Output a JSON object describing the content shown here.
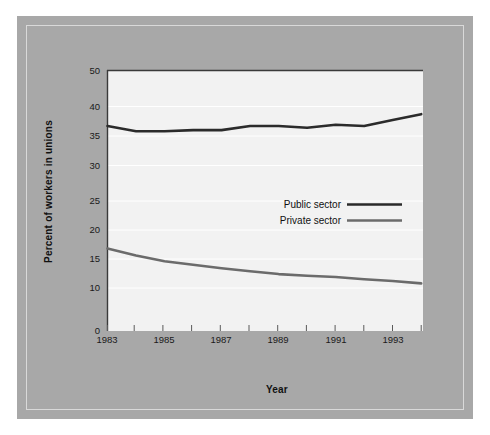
{
  "chart_data": {
    "type": "line",
    "title": "",
    "xlabel": "Year",
    "ylabel": "Percent of workers in unions",
    "x": [
      1983,
      1984,
      1985,
      1986,
      1987,
      1988,
      1989,
      1990,
      1991,
      1992,
      1993,
      1994
    ],
    "xtick_labels": [
      "1983",
      "1985",
      "1987",
      "1989",
      "1991",
      "1993"
    ],
    "xtick_values": [
      1983,
      1985,
      1987,
      1989,
      1991,
      1993
    ],
    "ytick_labels": [
      "0",
      "10",
      "15",
      "20",
      "25",
      "30",
      "35",
      "40",
      "50"
    ],
    "ytick_values": [
      0,
      10,
      15,
      20,
      25,
      30,
      35,
      40,
      50
    ],
    "ylim": [
      0,
      50
    ],
    "xlim": [
      1983,
      1994
    ],
    "grid": true,
    "legend_position": "center-right",
    "series": [
      {
        "name": "Public sector",
        "color": "#2b2b2b",
        "values": [
          36.7,
          35.8,
          35.8,
          36.0,
          36.0,
          36.7,
          36.7,
          36.4,
          36.9,
          36.7,
          37.7,
          38.7
        ]
      },
      {
        "name": "Private sector",
        "color": "#6b6b6b",
        "values": [
          16.8,
          15.6,
          14.6,
          14.0,
          13.4,
          12.9,
          12.4,
          12.1,
          11.9,
          11.5,
          11.2,
          10.8
        ]
      }
    ]
  },
  "axes": {
    "x_title": "Year",
    "y_title": "Percent of workers in unions"
  },
  "legend": {
    "items": [
      {
        "label": "Public sector",
        "color": "#2b2b2b"
      },
      {
        "label": "Private sector",
        "color": "#6b6b6b"
      }
    ]
  },
  "ticks": {
    "y": [
      "50",
      "40",
      "35",
      "30",
      "25",
      "20",
      "15",
      "10",
      "0"
    ],
    "x": [
      "1983",
      "1985",
      "1987",
      "1989",
      "1991",
      "1993"
    ]
  },
  "colors": {
    "mat_background": "#a8a8a8",
    "plot_background": "#f2f2f2",
    "page_background": "#ffffff",
    "axis": "#333333",
    "gridline": "#ffffff"
  }
}
